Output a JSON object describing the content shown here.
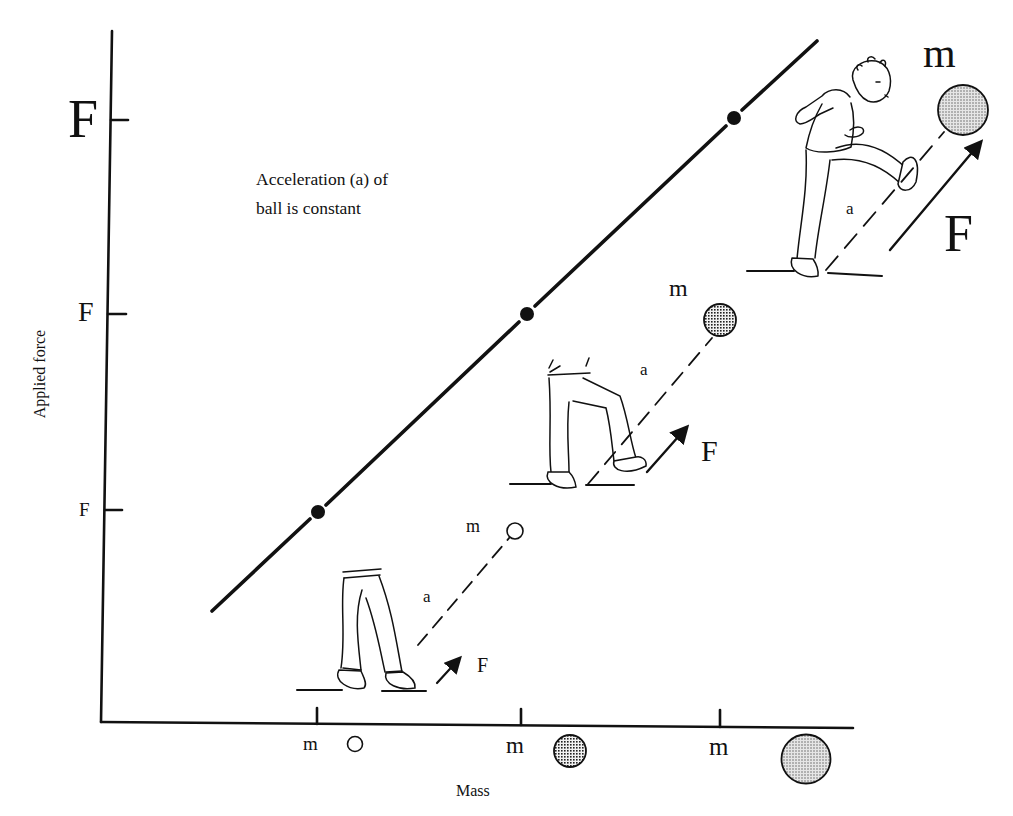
{
  "figure": {
    "type": "force-vs-mass diagram",
    "y_axis": {
      "label": "Applied force",
      "ticks": [
        {
          "label": "F",
          "size": "small",
          "y_px": 510
        },
        {
          "label": "F",
          "size": "medium",
          "y_px": 314
        },
        {
          "label": "F",
          "size": "large",
          "y_px": 120
        }
      ]
    },
    "x_axis": {
      "label": "Mass",
      "ticks": [
        {
          "label": "m",
          "size": "small",
          "x_px": 317,
          "ball": "light-hollow"
        },
        {
          "label": "m",
          "size": "medium",
          "x_px": 521,
          "ball": "dark-crosshatch"
        },
        {
          "label": "m",
          "size": "large",
          "x_px": 720,
          "ball": "medium-stipple"
        }
      ]
    },
    "annotation": {
      "line1": "Acceleration (a) of",
      "line2": "ball is constant"
    },
    "line_points": [
      {
        "x_px": 318,
        "y_px": 512
      },
      {
        "x_px": 527,
        "y_px": 314
      },
      {
        "x_px": 734,
        "y_px": 118
      }
    ],
    "line_extent": {
      "start": [
        212,
        611
      ],
      "end": [
        817,
        41
      ]
    },
    "scenes": [
      {
        "name": "small",
        "mass_label": "m",
        "accel_label": "a",
        "force_label": "F"
      },
      {
        "name": "medium",
        "mass_label": "m",
        "accel_label": "a",
        "force_label": "F"
      },
      {
        "name": "large",
        "mass_label": "m",
        "accel_label": "a",
        "force_label": "F"
      }
    ]
  },
  "colors": {
    "ink": "#111111",
    "background": "#ffffff",
    "ball_light": "#ffffff",
    "ball_dark": "#555555",
    "ball_stipple": "#b8b8b8"
  }
}
